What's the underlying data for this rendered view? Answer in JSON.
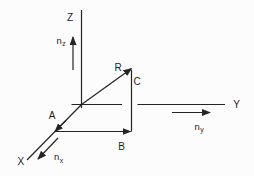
{
  "figure": {
    "background": "#fcfcfc",
    "stroke_color": "#242424",
    "label_color": "#1c1c1c",
    "axes": [
      {
        "name": "z-axis-line",
        "x1": 81.5,
        "y1": 108,
        "x2": 81.5,
        "y2": 10,
        "arrow": false
      },
      {
        "name": "y-axis-line-left",
        "x1": 71.5,
        "y1": 104.5,
        "x2": 122,
        "y2": 104.5,
        "arrow": false
      },
      {
        "name": "y-axis-line-right",
        "x1": 137.5,
        "y1": 104.5,
        "x2": 225,
        "y2": 104.5,
        "arrow": false
      },
      {
        "name": "x-axis-line",
        "x1": 81.5,
        "y1": 104.5,
        "x2": 27,
        "y2": 160,
        "arrow": false
      }
    ],
    "vectors": [
      {
        "name": "vector-R",
        "x1": 81.5,
        "y1": 104.5,
        "x2": 131.5,
        "y2": 68.5,
        "arrow": true
      },
      {
        "name": "vector-A-arrowhead",
        "x1": 66,
        "y1": 120.3,
        "x2": 55,
        "y2": 131.5,
        "arrow": true
      },
      {
        "name": "vector-B",
        "x1": 55,
        "y1": 131.5,
        "x2": 130.5,
        "y2": 131.5,
        "arrow": true
      },
      {
        "name": "segment-C",
        "x1": 131.5,
        "y1": 131.5,
        "x2": 131.5,
        "y2": 70,
        "arrow": false
      },
      {
        "name": "unit-vector-nz",
        "x1": 73,
        "y1": 70,
        "x2": 73,
        "y2": 37,
        "arrow": true
      },
      {
        "name": "unit-vector-nx",
        "x1": 58,
        "y1": 138,
        "x2": 38,
        "y2": 159,
        "arrow": true
      },
      {
        "name": "unit-vector-ny",
        "x1": 172,
        "y1": 112.5,
        "x2": 210,
        "y2": 112.5,
        "arrow": true
      }
    ],
    "labels": [
      {
        "name": "label-Z",
        "text": "Z",
        "x": 70,
        "y": 17.5,
        "size": 10
      },
      {
        "name": "label-Y",
        "text": "Y",
        "x": 236.5,
        "y": 104,
        "size": 10
      },
      {
        "name": "label-X",
        "text": "X",
        "x": 20.8,
        "y": 161.5,
        "size": 10
      },
      {
        "name": "label-R",
        "text": "R",
        "x": 118,
        "y": 67,
        "size": 10
      },
      {
        "name": "label-A",
        "text": "A",
        "x": 52,
        "y": 115.2,
        "size": 10
      },
      {
        "name": "label-B",
        "text": "B",
        "x": 121.5,
        "y": 146,
        "size": 10
      },
      {
        "name": "label-C",
        "text": "C",
        "x": 137,
        "y": 81,
        "size": 10
      },
      {
        "name": "label-nz",
        "text": "n",
        "sub": "z",
        "x": 56.5,
        "y": 43.5,
        "size": 9.5
      },
      {
        "name": "label-nx",
        "text": "n",
        "sub": "x",
        "x": 54,
        "y": 160,
        "size": 9.5
      },
      {
        "name": "label-ny",
        "text": "n",
        "sub": "y",
        "x": 194.5,
        "y": 129.5,
        "size": 9.5
      }
    ]
  }
}
